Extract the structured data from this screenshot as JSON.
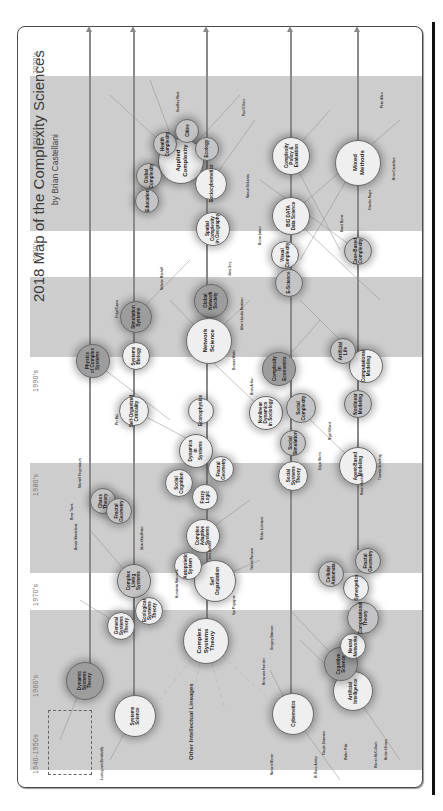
{
  "map": {
    "title": "2018 Map of the Complexity Sciences",
    "subtitle": "by Brian Castellani",
    "orientation": "rotated -90deg",
    "colors": {
      "band": "#cdcdcd",
      "circle_light": "#efefef",
      "circle_mid": "#c4c4c4",
      "circle_dark": "#9d9d9d",
      "arrow": "#8a8a8a",
      "border": "#4a4a4a"
    },
    "decades": [
      {
        "label": "2020's",
        "y": 60
      },
      {
        "label": "2010's",
        "y": 135
      },
      {
        "label": "2000's",
        "y": 248
      },
      {
        "label": "1990's",
        "y": 378
      },
      {
        "label": "1980's",
        "y": 482
      },
      {
        "label": "1970's",
        "y": 592
      },
      {
        "label": "1960's",
        "y": 683
      },
      {
        "label": "1940-1950s",
        "y": 760
      }
    ],
    "other_lineages": "Other Intellectual Lineages",
    "circles": [
      {
        "label": "Applied\nComplexity",
        "x": 180,
        "y": 160,
        "r": 22,
        "tone": "light",
        "big": true
      },
      {
        "label": "Global\nComplexity",
        "x": 148,
        "y": 175,
        "r": 12,
        "tone": "mid"
      },
      {
        "label": "Health\nComplexity",
        "x": 164,
        "y": 143,
        "r": 11,
        "tone": "mid"
      },
      {
        "label": "Cities",
        "x": 186,
        "y": 130,
        "r": 11,
        "tone": "mid"
      },
      {
        "label": "Ecology",
        "x": 206,
        "y": 148,
        "r": 11,
        "tone": "mid"
      },
      {
        "label": "Education",
        "x": 146,
        "y": 200,
        "r": 11,
        "tone": "mid"
      },
      {
        "label": "Sociocybernetics",
        "x": 210,
        "y": 183,
        "r": 15,
        "tone": "light"
      },
      {
        "label": "Complexity\nPolicy &\nEvaluation",
        "x": 290,
        "y": 155,
        "r": 18,
        "tone": "light"
      },
      {
        "label": "Mixed\nMethods",
        "x": 357,
        "y": 162,
        "r": 22,
        "tone": "light",
        "big": true
      },
      {
        "label": "BIG DATA\nData Science",
        "x": 290,
        "y": 215,
        "r": 18,
        "tone": "light"
      },
      {
        "label": "Visual\nComplexity",
        "x": 284,
        "y": 254,
        "r": 13,
        "tone": "light"
      },
      {
        "label": "Case-Based\nComplexity",
        "x": 357,
        "y": 250,
        "r": 13,
        "tone": "mid"
      },
      {
        "label": "Spatial\nComplexity\nin Geography",
        "x": 212,
        "y": 228,
        "r": 16,
        "tone": "light"
      },
      {
        "label": "Global\nNetwork\nSociety",
        "x": 210,
        "y": 300,
        "r": 16,
        "tone": "dark"
      },
      {
        "label": "Network\nScience",
        "x": 208,
        "y": 340,
        "r": 22,
        "tone": "light",
        "big": true
      },
      {
        "label": "E-Science",
        "x": 288,
        "y": 282,
        "r": 13,
        "tone": "mid"
      },
      {
        "label": "Simulation\nSystems",
        "x": 135,
        "y": 316,
        "r": 15,
        "tone": "dark"
      },
      {
        "label": "Systems\nBiology",
        "x": 135,
        "y": 355,
        "r": 13,
        "tone": "light"
      },
      {
        "label": "Physics\nof Complex\nSystems",
        "x": 92,
        "y": 360,
        "r": 16,
        "tone": "dark"
      },
      {
        "label": "Self-Organized\nCriticality",
        "x": 133,
        "y": 410,
        "r": 14,
        "tone": "light"
      },
      {
        "label": "Econophysics",
        "x": 200,
        "y": 410,
        "r": 12,
        "tone": "light"
      },
      {
        "label": "Dynamics\nin\nSystems",
        "x": 195,
        "y": 450,
        "r": 16,
        "tone": "light"
      },
      {
        "label": "Fractal\nGeometry",
        "x": 220,
        "y": 468,
        "r": 12,
        "tone": "light"
      },
      {
        "label": "Social\nCognition",
        "x": 178,
        "y": 482,
        "r": 13,
        "tone": "light"
      },
      {
        "label": "Fuzzy\nLogic",
        "x": 204,
        "y": 496,
        "r": 12,
        "tone": "light"
      },
      {
        "label": "Complexity\nin\nEconomics",
        "x": 278,
        "y": 368,
        "r": 16,
        "tone": "dark"
      },
      {
        "label": "Nonlinear\nDynamics\nin Sociology",
        "x": 265,
        "y": 412,
        "r": 16,
        "tone": "light"
      },
      {
        "label": "Social\nComplexity",
        "x": 300,
        "y": 407,
        "r": 14,
        "tone": "mid"
      },
      {
        "label": "Social\nSimulation",
        "x": 292,
        "y": 442,
        "r": 12,
        "tone": "mid"
      },
      {
        "label": "Social\nSystems\nTheory",
        "x": 292,
        "y": 475,
        "r": 14,
        "tone": "light"
      },
      {
        "label": "Computational\nModeling",
        "x": 365,
        "y": 365,
        "r": 16,
        "tone": "light"
      },
      {
        "label": "Artificial\nLife",
        "x": 342,
        "y": 350,
        "r": 12,
        "tone": "mid"
      },
      {
        "label": "Nonlinear\nModeling",
        "x": 357,
        "y": 403,
        "r": 13,
        "tone": "mid"
      },
      {
        "label": "Agent-Based\nModeling",
        "x": 357,
        "y": 465,
        "r": 18,
        "tone": "light"
      },
      {
        "label": "Complex\nAdaptive\nSystems",
        "x": 202,
        "y": 535,
        "r": 16,
        "tone": "light"
      },
      {
        "label": "Self\nOrganization",
        "x": 214,
        "y": 580,
        "r": 20,
        "tone": "light"
      },
      {
        "label": "Autopoietic\nSystem",
        "x": 187,
        "y": 565,
        "r": 13,
        "tone": "light"
      },
      {
        "label": "Complex\nLiving\nSystems",
        "x": 133,
        "y": 580,
        "r": 16,
        "tone": "mid"
      },
      {
        "label": "Chaos\nTheory",
        "x": 102,
        "y": 500,
        "r": 12,
        "tone": "mid"
      },
      {
        "label": "Fractal\nGeometry",
        "x": 118,
        "y": 510,
        "r": 12,
        "tone": "mid"
      },
      {
        "label": "General\nSystems\nTheory",
        "x": 120,
        "y": 625,
        "r": 13,
        "tone": "light"
      },
      {
        "label": "Ecological\nSystems\nTheory",
        "x": 148,
        "y": 610,
        "r": 13,
        "tone": "light"
      },
      {
        "label": "Complex\nSystems\nTheory",
        "x": 205,
        "y": 640,
        "r": 22,
        "tone": "light",
        "big": true
      },
      {
        "label": "Dynamic\nSystems\nTheory",
        "x": 84,
        "y": 680,
        "r": 18,
        "tone": "dark"
      },
      {
        "label": "Systems\nScience",
        "x": 134,
        "y": 715,
        "r": 20,
        "tone": "light"
      },
      {
        "label": "Cybernetics",
        "x": 292,
        "y": 713,
        "r": 20,
        "tone": "light"
      },
      {
        "label": "Artificial\nIntelligence",
        "x": 352,
        "y": 690,
        "r": 19,
        "tone": "light"
      },
      {
        "label": "Cognitive\nScience",
        "x": 340,
        "y": 663,
        "r": 16,
        "tone": "dark"
      },
      {
        "label": "Neural\nNetworks",
        "x": 352,
        "y": 645,
        "r": 12,
        "tone": "light"
      },
      {
        "label": "Computational\nTheory",
        "x": 362,
        "y": 617,
        "r": 15,
        "tone": "mid"
      },
      {
        "label": "Synergetics",
        "x": 355,
        "y": 587,
        "r": 12,
        "tone": "light"
      },
      {
        "label": "Fractal\nGeometry",
        "x": 367,
        "y": 560,
        "r": 12,
        "tone": "mid"
      },
      {
        "label": "Cellular\nAutomata",
        "x": 330,
        "y": 573,
        "r": 12,
        "tone": "mid"
      }
    ],
    "people": [
      {
        "text": "Ludwig von Bertalanffy",
        "x": 100,
        "y": 780
      },
      {
        "text": "Norbert Wiener",
        "x": 270,
        "y": 775
      },
      {
        "text": "W. Ross Ashby",
        "x": 314,
        "y": 778
      },
      {
        "text": "Claude Shannon",
        "x": 322,
        "y": 755
      },
      {
        "text": "Walter Pitts",
        "x": 344,
        "y": 760
      },
      {
        "text": "Warren McCulloch",
        "x": 374,
        "y": 768
      },
      {
        "text": "Herbert Simon",
        "x": 384,
        "y": 760
      },
      {
        "text": "Ilya Prigogine",
        "x": 232,
        "y": 615
      },
      {
        "text": "Stuart Kauffman",
        "x": 140,
        "y": 550
      },
      {
        "text": "Niklas Luhmann",
        "x": 260,
        "y": 540
      },
      {
        "text": "Talcott Parsons",
        "x": 250,
        "y": 570
      },
      {
        "text": "Duncan Watts",
        "x": 232,
        "y": 370
      },
      {
        "text": "Albert-Laszlo Barabasi",
        "x": 240,
        "y": 330
      },
      {
        "text": "Per Bak",
        "x": 115,
        "y": 425
      },
      {
        "text": "Thomas Schelling",
        "x": 378,
        "y": 480
      },
      {
        "text": "Brian Arthur",
        "x": 250,
        "y": 395
      },
      {
        "text": "Fritjof Capra",
        "x": 115,
        "y": 318
      },
      {
        "text": "Bruno Latour",
        "x": 258,
        "y": 245
      },
      {
        "text": "Manuel DeLanda",
        "x": 246,
        "y": 198
      },
      {
        "text": "Geoffrey West",
        "x": 176,
        "y": 112
      },
      {
        "text": "David Byrne",
        "x": 340,
        "y": 232
      },
      {
        "text": "Paul Cilliers",
        "x": 242,
        "y": 116
      },
      {
        "text": "John Urry",
        "x": 228,
        "y": 276
      },
      {
        "text": "Edgar Morin",
        "x": 318,
        "y": 470
      },
      {
        "text": "John Holland",
        "x": 208,
        "y": 560
      },
      {
        "text": "Gregory Bateson",
        "x": 270,
        "y": 650
      },
      {
        "text": "Heinz von Foerster",
        "x": 262,
        "y": 685
      },
      {
        "text": "Humberto Maturana",
        "x": 175,
        "y": 598
      },
      {
        "text": "Robert Axelrod",
        "x": 360,
        "y": 495
      },
      {
        "text": "Mitchell Feigenbaum",
        "x": 78,
        "y": 488
      },
      {
        "text": "Benoit Mandelbrot",
        "x": 74,
        "y": 550
      },
      {
        "text": "Rene Thom",
        "x": 70,
        "y": 520
      },
      {
        "text": "Nigel Gilbert",
        "x": 328,
        "y": 440
      },
      {
        "text": "Melanie Mitchell",
        "x": 160,
        "y": 290
      },
      {
        "text": "Peter Allen",
        "x": 380,
        "y": 108
      },
      {
        "text": "Brian Castellani",
        "x": 392,
        "y": 180
      },
      {
        "text": "Charles Ragin",
        "x": 368,
        "y": 210
      }
    ],
    "arrows_x": [
      89,
      133,
      206,
      290,
      357
    ]
  }
}
